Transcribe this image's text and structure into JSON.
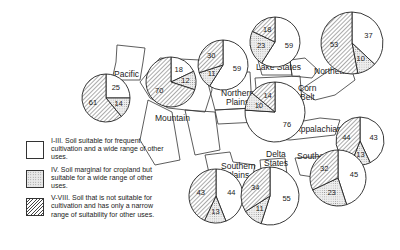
{
  "legend": [
    {
      "key": "I-III",
      "pattern": "blank",
      "text": "I-III. Soil suitable for frequent cultivation and a wide range of other uses."
    },
    {
      "key": "IV",
      "pattern": "dotted",
      "text": "IV. Soil marginal for cropland but suitable for a wide range of other uses."
    },
    {
      "key": "V-VIII",
      "pattern": "hatched",
      "text": "V-VIII. Soil that is not suitable for cultivation and has only a narrow range of suitability for other uses."
    }
  ],
  "regions": {
    "pacific": "Pacific",
    "mountain": "Mountain",
    "northern_plains_1": "Northern",
    "northern_plains_2": "Plains",
    "lake_states": "Lake States",
    "corn_belt_1": "Corn",
    "corn_belt_2": "Belt",
    "northeast": "Northeast",
    "appalachian": "Appalachian",
    "southeast": "Southeast",
    "southern_plains_1": "Southern",
    "southern_plains_2": "Plains",
    "delta_states_1": "Delta",
    "delta_states_2": "States"
  },
  "chart_data": {
    "type": "pie",
    "title": "",
    "categories": [
      "I-III",
      "IV",
      "V-VIII"
    ],
    "legend_position": "left",
    "pies": [
      {
        "region": "Pacific",
        "values": {
          "I-III": 25,
          "IV": 14,
          "V-VIII": 61
        }
      },
      {
        "region": "Mountain",
        "values": {
          "I-III": 18,
          "IV": 12,
          "V-VIII": 70
        }
      },
      {
        "region": "Northern Plains",
        "values": {
          "I-III": 59,
          "IV": 11,
          "V-VIII": 30
        }
      },
      {
        "region": "Lake States",
        "values": {
          "I-III": 59,
          "IV": 23,
          "V-VIII": 18
        }
      },
      {
        "region": "Corn Belt",
        "values": {
          "I-III": 76,
          "IV": 10,
          "V-VIII": 14
        }
      },
      {
        "region": "Northeast",
        "values": {
          "I-III": 37,
          "IV": 10,
          "V-VIII": 53
        }
      },
      {
        "region": "Appalachian",
        "values": {
          "I-III": 43,
          "IV": 13,
          "V-VIII": 44
        }
      },
      {
        "region": "Southeast",
        "values": {
          "I-III": 45,
          "IV": 23,
          "V-VIII": 32
        }
      },
      {
        "region": "Southern Plains",
        "values": {
          "I-III": 44,
          "IV": 13,
          "V-VIII": 43
        }
      },
      {
        "region": "Delta States",
        "values": {
          "I-III": 55,
          "IV": 11,
          "V-VIII": 34
        }
      }
    ]
  }
}
